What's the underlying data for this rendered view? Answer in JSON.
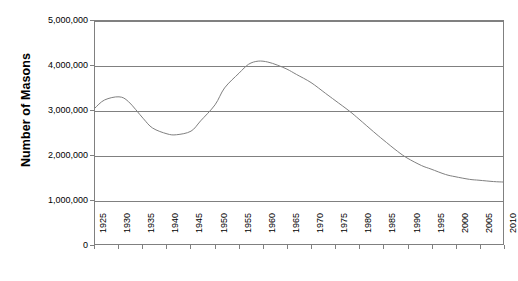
{
  "chart_data": {
    "type": "line",
    "title": "",
    "xlabel": "",
    "ylabel": "Number of Masons",
    "xlim": [
      1925,
      2010
    ],
    "ylim": [
      0,
      5000000
    ],
    "grid": true,
    "legend": null,
    "y_ticks": [
      {
        "value": 5000000,
        "label": "5,000,000"
      },
      {
        "value": 4000000,
        "label": "4,000,000"
      },
      {
        "value": 3000000,
        "label": "3,000,000"
      },
      {
        "value": 2000000,
        "label": "2,000,000"
      },
      {
        "value": 1000000,
        "label": "1,000,000"
      },
      {
        "value": 0,
        "label": "0"
      }
    ],
    "x_ticks": [
      "1925",
      "1930",
      "1935",
      "1940",
      "1945",
      "1950",
      "1955",
      "1960",
      "1965",
      "1970",
      "1975",
      "1980",
      "1985",
      "1990",
      "1995",
      "2000",
      "2005",
      "2010"
    ],
    "series": [
      {
        "name": "Number of Masons",
        "color": "#808080",
        "x": [
          1925,
          1927,
          1930,
          1932,
          1935,
          1937,
          1940,
          1942,
          1945,
          1947,
          1950,
          1952,
          1955,
          1957,
          1959,
          1961,
          1963,
          1965,
          1967,
          1970,
          1973,
          1975,
          1978,
          1980,
          1983,
          1985,
          1988,
          1990,
          1993,
          1995,
          1998,
          2000,
          2003,
          2005,
          2008,
          2010
        ],
        "values": [
          3050000,
          3230000,
          3300000,
          3190000,
          2820000,
          2600000,
          2470000,
          2450000,
          2530000,
          2760000,
          3120000,
          3500000,
          3830000,
          4030000,
          4100000,
          4080000,
          4010000,
          3920000,
          3800000,
          3620000,
          3380000,
          3220000,
          2980000,
          2800000,
          2520000,
          2340000,
          2080000,
          1930000,
          1760000,
          1680000,
          1560000,
          1510000,
          1450000,
          1430000,
          1400000,
          1390000
        ]
      }
    ]
  },
  "axis": {
    "y_title": "Number of Masons"
  }
}
